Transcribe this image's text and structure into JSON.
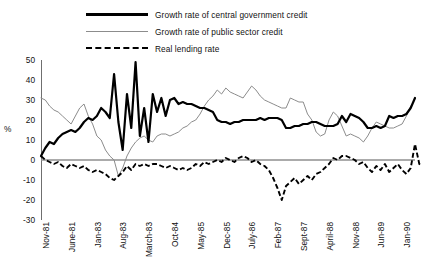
{
  "chart_data": {
    "type": "line",
    "title": "",
    "xlabel": "",
    "ylabel": "%",
    "ylim": [
      -30,
      50
    ],
    "yticks": [
      50,
      40,
      30,
      20,
      10,
      0,
      -10,
      -20,
      -30
    ],
    "grid": false,
    "zero_line": true,
    "legend_position": "top",
    "xtick_labels": [
      "Nov-81",
      "June-81",
      "Jan-83",
      "Aug-83",
      "March-83",
      "Oct-84",
      "May-85",
      "Dec-85",
      "July-86",
      "Feb-87",
      "Sept-87",
      "April-88",
      "Nov-88",
      "Jun-89",
      "Jan-90"
    ],
    "x_index": [
      0,
      6,
      12,
      18,
      24,
      30,
      36,
      42,
      48,
      54,
      60,
      66,
      72,
      78,
      84
    ],
    "n_points": 88,
    "series": [
      {
        "name": "Growth rate of central government credit",
        "style": "solid-thick",
        "color": "#000000",
        "values": [
          2,
          6,
          9,
          8,
          11,
          13,
          14,
          15,
          14,
          16,
          19,
          21,
          20,
          22,
          26,
          24,
          21,
          43,
          19,
          5,
          33,
          16,
          49,
          12,
          26,
          9,
          33,
          24,
          31,
          22,
          30,
          31,
          28,
          29,
          28,
          28,
          27,
          26,
          26,
          25,
          24,
          20,
          19,
          19,
          18,
          19,
          19,
          20,
          20,
          20,
          20,
          21,
          20,
          21,
          21,
          21,
          20,
          16,
          16,
          17,
          17,
          18,
          18,
          19,
          19,
          18,
          17,
          17,
          17,
          18,
          22,
          19,
          23,
          22,
          21,
          19,
          16,
          16,
          17,
          16,
          17,
          22,
          21,
          22,
          22,
          23,
          26,
          31
        ]
      },
      {
        "name": "Growth rate of public sector credit",
        "style": "solid-thin",
        "color": "#8c8c8c",
        "values": [
          31,
          30,
          27,
          25,
          24,
          22,
          20,
          18,
          22,
          26,
          28,
          22,
          18,
          12,
          10,
          5,
          2,
          0,
          -8,
          -4,
          2,
          6,
          9,
          11,
          12,
          10,
          9,
          12,
          13,
          13,
          12,
          13,
          14,
          16,
          17,
          19,
          20,
          23,
          27,
          30,
          32,
          35,
          33,
          36,
          34,
          33,
          32,
          31,
          34,
          37,
          35,
          32,
          30,
          29,
          28,
          27,
          26,
          26,
          31,
          30,
          29,
          29,
          23,
          20,
          14,
          12,
          13,
          20,
          24,
          22,
          17,
          12,
          13,
          12,
          11,
          9,
          12,
          16,
          19,
          18,
          17,
          16,
          16,
          17,
          18,
          22,
          27
        ]
      },
      {
        "name": "Real lending rate",
        "style": "dashed",
        "color": "#000000",
        "values": [
          2,
          0,
          -1,
          -2,
          -1,
          -3,
          -4,
          -2,
          -3,
          -4,
          -3,
          -5,
          -6,
          -5,
          -6,
          -7,
          -9,
          -10,
          -8,
          -6,
          -3,
          -5,
          -2,
          -3,
          -2,
          -3,
          -2,
          -2,
          -3,
          -4,
          -3,
          -4,
          -5,
          -4,
          -5,
          -4,
          -2,
          -3,
          -1,
          -2,
          -1,
          0,
          -1,
          1,
          0,
          -1,
          1,
          2,
          1,
          -1,
          0,
          -2,
          -3,
          -5,
          -9,
          -14,
          -20,
          -13,
          -11,
          -9,
          -12,
          -10,
          -8,
          -10,
          -7,
          -6,
          -4,
          -2,
          1,
          0,
          2,
          2,
          1,
          0,
          -2,
          -1,
          -4,
          -6,
          -3,
          -5,
          -2,
          -6,
          -4,
          -2,
          -5,
          -7,
          -4,
          8,
          -2,
          -3
        ]
      }
    ]
  },
  "legend": {
    "items": [
      {
        "label": "Growth rate of central government credit",
        "style": "thick"
      },
      {
        "label": "Growth rate of public sector credit",
        "style": "thin"
      },
      {
        "label": "Real lending rate",
        "style": "dash"
      }
    ]
  }
}
